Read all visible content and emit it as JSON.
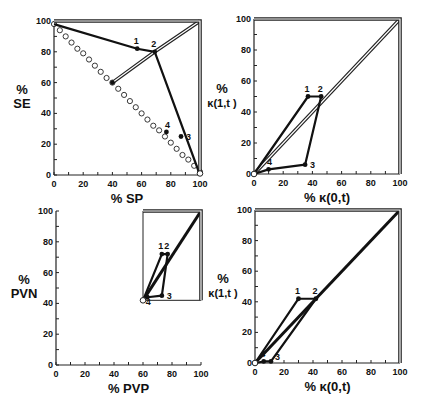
{
  "chart_data": [
    {
      "type": "line",
      "id": "top-left",
      "xlabel": "% SP",
      "ylabel": [
        "%",
        "SE"
      ],
      "xlim": [
        0,
        100
      ],
      "ylim": [
        0,
        100
      ],
      "xticks": [
        0,
        20,
        40,
        60,
        80,
        100
      ],
      "yticks": [
        0,
        20,
        40,
        60,
        80,
        100
      ],
      "frame": {
        "x0": 54,
        "x1": 200,
        "y0": 175,
        "y1": 21
      },
      "reference_circles": [
        [
          0,
          98
        ],
        [
          4,
          94
        ],
        [
          8,
          90
        ],
        [
          12,
          86
        ],
        [
          16,
          82
        ],
        [
          20,
          79
        ],
        [
          24,
          75
        ],
        [
          28,
          71
        ],
        [
          32,
          67
        ],
        [
          36,
          63
        ],
        [
          40,
          60
        ],
        [
          44,
          56
        ],
        [
          48,
          52
        ],
        [
          52,
          48
        ],
        [
          56,
          44
        ],
        [
          60,
          40
        ],
        [
          64,
          36
        ],
        [
          68,
          32
        ],
        [
          72,
          29
        ],
        [
          76,
          25
        ],
        [
          80,
          21
        ],
        [
          84,
          17
        ],
        [
          88,
          13
        ],
        [
          92,
          10
        ],
        [
          96,
          6
        ],
        [
          100,
          2
        ]
      ],
      "polylines": [
        {
          "style": "solid",
          "points": [
            [
              0,
              98
            ],
            [
              57,
              82
            ],
            [
              69,
              80
            ],
            [
              100,
              0
            ]
          ]
        },
        {
          "style": "double",
          "points": [
            [
              40,
              60
            ],
            [
              69,
              80
            ],
            [
              100,
              100
            ]
          ]
        },
        {
          "style": "frame-double",
          "points": [
            [
              0,
              100
            ],
            [
              100,
              100
            ],
            [
              100,
              0
            ]
          ]
        }
      ],
      "points": [
        {
          "label": "1",
          "x": 57,
          "y": 82
        },
        {
          "label": "2",
          "x": 69,
          "y": 80
        },
        {
          "label": "3",
          "x": 87,
          "y": 25
        },
        {
          "label": "4",
          "x": 77,
          "y": 28
        },
        {
          "label": "",
          "x": 40,
          "y": 60
        }
      ],
      "open_points": [
        {
          "x": 100,
          "y": 1
        }
      ]
    },
    {
      "type": "line",
      "id": "top-right",
      "xlabel": "% κ(0,t)",
      "ylabel": [
        "%",
        "κ(1,t )"
      ],
      "xlim": [
        0,
        100
      ],
      "ylim": [
        0,
        100
      ],
      "xticks": [
        0,
        20,
        40,
        60,
        80,
        100
      ],
      "yticks": [
        0,
        20,
        40,
        60,
        80,
        100
      ],
      "frame": {
        "x0": 254,
        "x1": 400,
        "y0": 174,
        "y1": 19
      },
      "polylines": [
        {
          "style": "double",
          "points": [
            [
              0,
              0
            ],
            [
              100,
              100
            ]
          ]
        },
        {
          "style": "solid",
          "points": [
            [
              0,
              0
            ],
            [
              37,
              50
            ],
            [
              46,
              50
            ],
            [
              35,
              6
            ],
            [
              10,
              3
            ],
            [
              0,
              0
            ]
          ]
        },
        {
          "style": "frame-double",
          "points": [
            [
              0,
              100
            ],
            [
              100,
              100
            ],
            [
              100,
              0
            ]
          ]
        }
      ],
      "points": [
        {
          "label": "1",
          "x": 37,
          "y": 50
        },
        {
          "label": "2",
          "x": 46,
          "y": 50
        },
        {
          "label": "3",
          "x": 35,
          "y": 6
        },
        {
          "label": "4",
          "x": 10,
          "y": 3
        }
      ],
      "open_points": [
        {
          "x": 0,
          "y": 0
        }
      ]
    },
    {
      "type": "line",
      "id": "bottom-left",
      "xlabel": "% PVP",
      "ylabel": [
        "%",
        "PVN"
      ],
      "xlim": [
        0,
        100
      ],
      "ylim": [
        0,
        100
      ],
      "xticks": [
        0,
        20,
        40,
        60,
        80,
        100
      ],
      "yticks": [
        0,
        20,
        40,
        60,
        80,
        100
      ],
      "frame": {
        "x0": 56,
        "x1": 201,
        "y0": 365,
        "y1": 211
      },
      "polylines": [
        {
          "style": "thin",
          "points": [
            [
              60,
              42
            ],
            [
              60,
              100
            ],
            [
              100,
              100
            ],
            [
              100,
              42
            ],
            [
              60,
              42
            ]
          ]
        },
        {
          "style": "thick",
          "points": [
            [
              60,
              42
            ],
            [
              100,
              100
            ]
          ]
        },
        {
          "style": "solid",
          "points": [
            [
              60,
              42
            ],
            [
              73,
              72
            ],
            [
              77,
              72
            ],
            [
              73,
              45
            ],
            [
              63,
              44
            ],
            [
              60,
              42
            ]
          ]
        },
        {
          "style": "frame-double",
          "points": [
            [
              60,
              100
            ],
            [
              100,
              100
            ],
            [
              100,
              42
            ]
          ]
        }
      ],
      "points": [
        {
          "label": "1",
          "x": 73,
          "y": 72
        },
        {
          "label": "2",
          "x": 77,
          "y": 72
        },
        {
          "label": "3",
          "x": 73,
          "y": 45
        },
        {
          "label": "4",
          "x": 63,
          "y": 44
        }
      ],
      "open_points": [
        {
          "x": 60,
          "y": 42
        }
      ]
    },
    {
      "type": "line",
      "id": "bottom-right",
      "xlabel": "% κ(0,t)",
      "ylabel": [
        "%",
        "κ(1,t )"
      ],
      "xlim": [
        0,
        100
      ],
      "ylim": [
        0,
        100
      ],
      "xticks": [
        0,
        20,
        40,
        60,
        80,
        100
      ],
      "yticks": [
        0,
        20,
        40,
        60,
        80,
        100
      ],
      "frame": {
        "x0": 255,
        "x1": 400,
        "y0": 363,
        "y1": 210
      },
      "polylines": [
        {
          "style": "thick",
          "points": [
            [
              0,
              0
            ],
            [
              100,
              100
            ]
          ]
        },
        {
          "style": "solid",
          "points": [
            [
              0,
              0
            ],
            [
              30,
              42
            ],
            [
              42,
              42
            ],
            [
              11,
              1
            ],
            [
              6,
              1
            ],
            [
              0,
              0
            ]
          ]
        },
        {
          "style": "frame-double",
          "points": [
            [
              0,
              100
            ],
            [
              100,
              100
            ],
            [
              100,
              0
            ]
          ]
        }
      ],
      "points": [
        {
          "label": "1",
          "x": 30,
          "y": 42
        },
        {
          "label": "2",
          "x": 42,
          "y": 42
        },
        {
          "label": "3",
          "x": 11,
          "y": 1
        },
        {
          "label": "4",
          "x": 6,
          "y": 1
        }
      ],
      "open_points": [
        {
          "x": 0,
          "y": 0
        }
      ]
    }
  ]
}
